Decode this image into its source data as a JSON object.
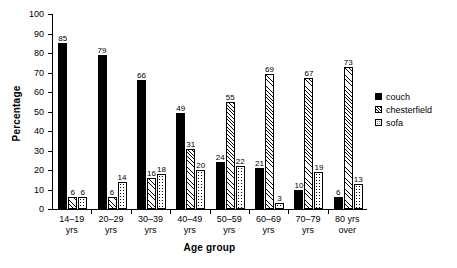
{
  "chart_data": {
    "type": "bar",
    "title": "",
    "xlabel": "Age group",
    "ylabel": "Percentage",
    "ylim": [
      0,
      100
    ],
    "yticks": [
      0,
      10,
      20,
      30,
      40,
      50,
      60,
      70,
      80,
      90,
      100
    ],
    "grid": false,
    "legend_position": "right",
    "categories": [
      "14–19\nyrs",
      "20–29\nyrs",
      "30–39\nyrs",
      "40–49\nyrs",
      "50–59\nyrs",
      "60–69\nyrs",
      "70–79\nyrs",
      "80 yrs\nover"
    ],
    "series": [
      {
        "name": "couch",
        "fill": "solid-black",
        "color": "#000000",
        "values": [
          85,
          79,
          66,
          49,
          24,
          21,
          10,
          6
        ]
      },
      {
        "name": "chesterfield",
        "fill": "diagonal-hatch",
        "color": "#ffffff",
        "values": [
          6,
          6,
          16,
          31,
          55,
          69,
          67,
          73
        ]
      },
      {
        "name": "sofa",
        "fill": "dotted",
        "color": "#ffffff",
        "values": [
          6,
          14,
          18,
          20,
          22,
          3,
          19,
          13
        ]
      }
    ]
  },
  "legend": {
    "items": [
      {
        "label": "couch"
      },
      {
        "label": "chesterfield"
      },
      {
        "label": "sofa"
      }
    ]
  }
}
